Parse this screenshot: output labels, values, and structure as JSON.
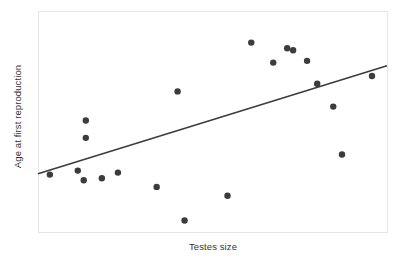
{
  "chart_data": {
    "type": "scatter",
    "title": "",
    "xlabel": "Testes size",
    "ylabel": "Age at first reproduction",
    "xlim": [
      0,
      100
    ],
    "ylim": [
      0,
      100
    ],
    "grid": false,
    "legend": null,
    "marker": {
      "shape": "circle",
      "color": "#3c3c3c",
      "size_px": 6.4
    },
    "points": [
      {
        "x": 3.4,
        "y": 26.1
      },
      {
        "x": 13.7,
        "y": 50.7
      },
      {
        "x": 13.7,
        "y": 42.8
      },
      {
        "x": 11.4,
        "y": 27.9
      },
      {
        "x": 13.1,
        "y": 23.5
      },
      {
        "x": 18.3,
        "y": 24.4
      },
      {
        "x": 22.9,
        "y": 27.0
      },
      {
        "x": 40.0,
        "y": 63.9
      },
      {
        "x": 34.0,
        "y": 20.5
      },
      {
        "x": 42.0,
        "y": 5.2
      },
      {
        "x": 54.3,
        "y": 16.5
      },
      {
        "x": 61.1,
        "y": 86.1
      },
      {
        "x": 67.4,
        "y": 77.0
      },
      {
        "x": 71.4,
        "y": 83.5
      },
      {
        "x": 73.1,
        "y": 82.6
      },
      {
        "x": 77.1,
        "y": 77.8
      },
      {
        "x": 80.0,
        "y": 67.4
      },
      {
        "x": 84.6,
        "y": 57.0
      },
      {
        "x": 87.1,
        "y": 35.2
      },
      {
        "x": 95.7,
        "y": 70.9
      }
    ],
    "trendline": {
      "type": "linear-regression",
      "x_start": 0,
      "y_start": 26.5,
      "x_end": 100,
      "y_end": 75.6,
      "color": "#3c3c3c",
      "width_px": 1.6
    },
    "frame": {
      "color": "#e6e6e6",
      "width_px": 1,
      "visible": true
    },
    "ticks": {
      "x": [],
      "y": []
    }
  }
}
